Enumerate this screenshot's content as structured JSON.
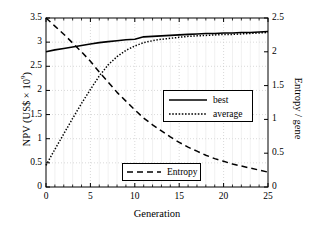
{
  "axes": {
    "x_label": "Generation",
    "y_left_label_prefix": "NPV (US$ × 10",
    "y_left_label_exp": "9",
    "y_left_label_suffix": ")",
    "y_right_label": "Entropy / gene",
    "x_ticks": [
      "0",
      "5",
      "10",
      "15",
      "20",
      "25"
    ],
    "y_left_ticks": [
      "0",
      "0.5",
      "1",
      "1.5",
      "2",
      "2.5",
      "3",
      "3.5"
    ],
    "y_right_ticks": [
      "0",
      "0.5",
      "1",
      "1.5",
      "2",
      "2.5"
    ]
  },
  "legends": {
    "series_box": [
      {
        "label": "best",
        "style": "solid"
      },
      {
        "label": "average",
        "style": "dotted"
      }
    ],
    "entropy_box": [
      {
        "label": "Entropy",
        "style": "dashed"
      }
    ]
  },
  "colors": {
    "line": "#000000",
    "grid": "#c8c8c8",
    "frame": "#000000",
    "background": "#ffffff"
  },
  "chart_data": {
    "type": "line",
    "title": "",
    "xlabel": "Generation",
    "ylabel": "NPV (US$ × 10^9)",
    "ylabel_right": "Entropy / gene",
    "xlim": [
      0,
      25
    ],
    "ylim": [
      0,
      3.5
    ],
    "ylim_right": [
      0,
      2.5
    ],
    "grid": true,
    "legend_position": "inside-right and inside-bottom-center",
    "x": [
      0,
      1,
      2,
      3,
      4,
      5,
      6,
      7,
      8,
      9,
      10,
      11,
      12,
      13,
      14,
      15,
      16,
      17,
      18,
      19,
      20,
      21,
      22,
      23,
      24,
      25
    ],
    "series": [
      {
        "name": "best",
        "axis": "left",
        "style": "solid",
        "values": [
          2.8,
          2.84,
          2.87,
          2.9,
          2.93,
          2.96,
          2.99,
          3.01,
          3.03,
          3.05,
          3.06,
          3.11,
          3.12,
          3.13,
          3.14,
          3.15,
          3.16,
          3.17,
          3.18,
          3.18,
          3.19,
          3.19,
          3.2,
          3.2,
          3.21,
          3.22
        ]
      },
      {
        "name": "average",
        "axis": "left",
        "style": "dotted",
        "values": [
          0.45,
          0.78,
          1.1,
          1.42,
          1.73,
          2.02,
          2.3,
          2.53,
          2.7,
          2.83,
          2.92,
          2.99,
          3.03,
          3.06,
          3.08,
          3.1,
          3.12,
          3.13,
          3.14,
          3.15,
          3.16,
          3.16,
          3.17,
          3.18,
          3.19,
          3.2
        ]
      },
      {
        "name": "Entropy",
        "axis": "right",
        "style": "dashed",
        "values": [
          2.5,
          2.38,
          2.26,
          2.13,
          2.0,
          1.86,
          1.7,
          1.55,
          1.4,
          1.27,
          1.14,
          1.02,
          0.92,
          0.83,
          0.74,
          0.66,
          0.59,
          0.53,
          0.47,
          0.42,
          0.38,
          0.34,
          0.31,
          0.28,
          0.25,
          0.22
        ]
      }
    ]
  }
}
